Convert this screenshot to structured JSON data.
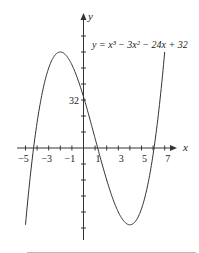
{
  "chart_data": {
    "type": "line",
    "title": "",
    "equation_label": "y = x³ − 3x² − 24x + 32",
    "xlabel": "x",
    "ylabel": "y",
    "x_tick_labels": [
      "−5",
      "−3",
      "−1",
      "1",
      "3",
      "5",
      "7"
    ],
    "x_ticks": [
      -5,
      -4,
      -3,
      -2,
      -1,
      0,
      1,
      2,
      3,
      4,
      5,
      6,
      7
    ],
    "y_tick_labels": [
      "32"
    ],
    "xlim": [
      -5,
      7
    ],
    "ylim": [
      -48,
      60
    ],
    "series": [
      {
        "name": "y = x^3 - 3x^2 - 24x + 32",
        "x": [
          -5,
          -4,
          -3,
          -2,
          -1,
          0,
          1,
          2,
          3,
          4,
          5,
          6,
          7
        ],
        "y": [
          -48,
          16,
          50,
          60,
          52,
          32,
          6,
          -20,
          -40,
          -48,
          -38,
          -4,
          60
        ]
      }
    ],
    "grid": false,
    "legend": "none"
  }
}
